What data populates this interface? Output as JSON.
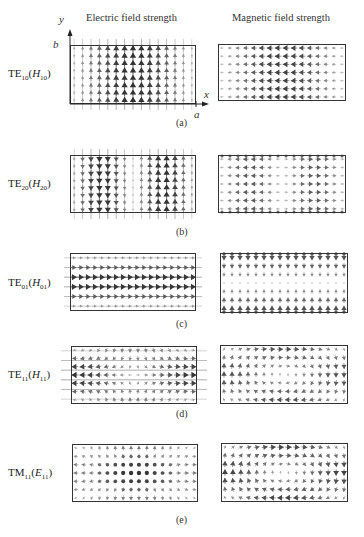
{
  "headers": {
    "electric": "Electric field strength",
    "magnetic": "Magnetic field strength"
  },
  "axes": {
    "x": "x",
    "y": "y",
    "a": "a",
    "b": "b"
  },
  "rows": [
    {
      "id": "a",
      "caption": "(a)",
      "mode": "TE",
      "mode_sub": "10",
      "alt": "H",
      "alt_sub": "10",
      "electric": {
        "pattern": "te10"
      },
      "magnetic": {
        "pattern": "te10"
      }
    },
    {
      "id": "b",
      "caption": "(b)",
      "mode": "TE",
      "mode_sub": "20",
      "alt": "H",
      "alt_sub": "20",
      "electric": {
        "pattern": "te20"
      },
      "magnetic": {
        "pattern": "te20"
      }
    },
    {
      "id": "c",
      "caption": "(c)",
      "mode": "TE",
      "mode_sub": "01",
      "alt": "H",
      "alt_sub": "01",
      "electric": {
        "pattern": "te01"
      },
      "magnetic": {
        "pattern": "te01"
      }
    },
    {
      "id": "d",
      "caption": "(d)",
      "mode": "TE",
      "mode_sub": "11",
      "alt": "H",
      "alt_sub": "11",
      "electric": {
        "pattern": "te11"
      },
      "magnetic": {
        "pattern": "te11"
      }
    },
    {
      "id": "e",
      "caption": "(e)",
      "mode": "TM",
      "mode_sub": "11",
      "alt": "E",
      "alt_sub": "11",
      "electric": {
        "pattern": "tm11"
      },
      "magnetic": {
        "pattern": "tm11"
      }
    }
  ],
  "colors": {
    "frame": "#333333",
    "arrow_dark": "#3a3a3a",
    "arrow_light": "#b0b0b0"
  }
}
